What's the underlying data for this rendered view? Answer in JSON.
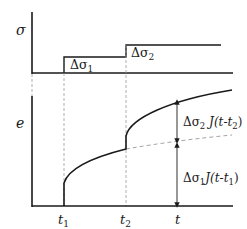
{
  "diagram": {
    "colors": {
      "line": "#1a1a1a",
      "dashed": "#9a9a9a",
      "background": "#ffffff"
    },
    "top_panel": {
      "y_axis_label": "σ",
      "steps": [
        {
          "label_delta": "Δσ",
          "label_sub": "1"
        },
        {
          "label_delta": "Δσ",
          "label_sub": "2"
        }
      ]
    },
    "bottom_panel": {
      "y_axis_label": "e",
      "x_axis_label": "t",
      "ticks": [
        {
          "label": "t",
          "sub": "1"
        },
        {
          "label": "t",
          "sub": "2"
        }
      ],
      "annotations": [
        {
          "text_pre": "Δσ",
          "sub1": "2",
          "text_mid": " J(t-t",
          "sub2": "2",
          "text_post": ")"
        },
        {
          "text_pre": "Δσ",
          "sub1": "1",
          "text_mid": "J(t-t",
          "sub2": "1",
          "text_post": ")"
        }
      ]
    }
  }
}
